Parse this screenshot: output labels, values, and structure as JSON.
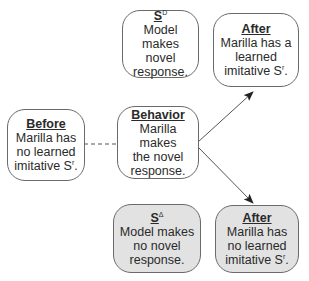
{
  "diagram": {
    "nodes": {
      "sd": {
        "title": "S",
        "title_superscript": "D",
        "lines": [
          "Model",
          "makes novel",
          "response."
        ],
        "shaded": false
      },
      "after_top": {
        "title": "After",
        "lines": [
          "Marilla has a",
          "learned",
          "imitative S"
        ],
        "superscript": "r",
        "suffix": ".",
        "shaded": false
      },
      "before": {
        "title": "Before",
        "lines": [
          "Marilla has",
          "no learned",
          "imitative S"
        ],
        "superscript": "r",
        "suffix": ".",
        "shaded": false
      },
      "behavior": {
        "title": "Behavior",
        "lines": [
          "Marilla makes",
          "the novel",
          "response."
        ],
        "shaded": false
      },
      "sdelta": {
        "title": "S",
        "title_superscript": "Δ",
        "lines": [
          "Model makes",
          "no novel",
          "response."
        ],
        "shaded": true
      },
      "after_bottom": {
        "title": "After",
        "lines": [
          "Marilla has",
          "no learned",
          "imitative S"
        ],
        "superscript": "r",
        "suffix": ".",
        "shaded": true
      }
    },
    "edges": [
      {
        "from": "before",
        "to": "behavior",
        "style": "dashed"
      },
      {
        "from": "behavior",
        "to": "after_top",
        "style": "arrow"
      },
      {
        "from": "behavior",
        "to": "after_bottom",
        "style": "arrow"
      }
    ],
    "colors": {
      "border": "#6a6a6a",
      "shaded_fill": "#e2e2e2",
      "line": "#555555",
      "text": "#2a2a2a"
    }
  }
}
